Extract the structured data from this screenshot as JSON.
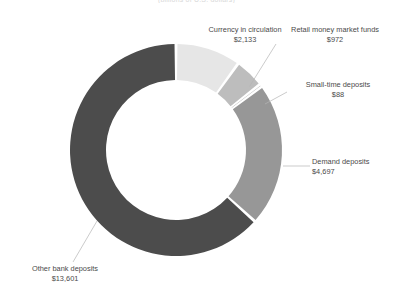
{
  "title": "(billions of U.S. dollars)",
  "chart_data": {
    "type": "pie",
    "variant": "donut",
    "title": "(billions of U.S. dollars)",
    "unit": "$ billions",
    "legend": "none",
    "labels_position": "outside-with-leader-lines",
    "total": 21491,
    "categories": [
      "Currency in circulation",
      "Retail money market funds",
      "Small-time deposits",
      "Demand deposits",
      "Other bank deposits"
    ],
    "values": [
      2133,
      972,
      88,
      4697,
      13601
    ],
    "value_labels": [
      "$2,133",
      "$972",
      "$88",
      "$4,697",
      "$13,601"
    ],
    "colors": [
      "#e6e6e6",
      "#bdbdbd",
      "#8f8f8f",
      "#979797",
      "#4c4c4c"
    ],
    "start_angle_deg": 0,
    "direction": "clockwise"
  },
  "slices": [
    {
      "name": "Currency in circulation",
      "value_label": "$2,133",
      "value": 2133,
      "color": "#e6e6e6"
    },
    {
      "name": "Retail money market funds",
      "value_label": "$972",
      "value": 972,
      "color": "#bdbdbd"
    },
    {
      "name": "Small-time deposits",
      "value_label": "$88",
      "value": 88,
      "color": "#8f8f8f"
    },
    {
      "name": "Demand deposits",
      "value_label": "$4,697",
      "value": 4697,
      "color": "#979797"
    },
    {
      "name": "Other bank deposits",
      "value_label": "$13,601",
      "value": 13601,
      "color": "#4c4c4c"
    }
  ],
  "geometry": {
    "center_x": 176,
    "center_y": 150,
    "outer_radius": 106,
    "inner_radius": 70,
    "gap_deg": 1.6
  }
}
